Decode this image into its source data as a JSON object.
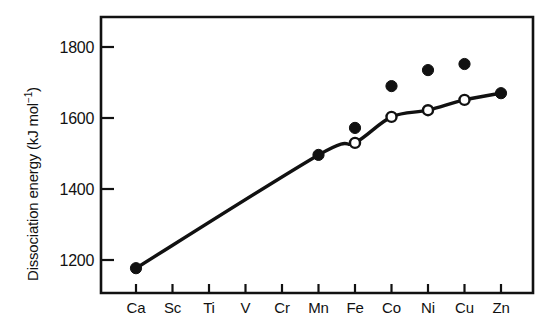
{
  "chart_data": {
    "type": "scatter",
    "title": "",
    "xlabel": "",
    "ylabel": "Dissociation energy (kJ mol⁻¹)",
    "ylabel_main": "Dissociation energy (kJ mol",
    "ylabel_superscript": "−1",
    "ylabel_close": ")",
    "categories": [
      "Ca",
      "Sc",
      "Ti",
      "V",
      "Cr",
      "Mn",
      "Fe",
      "Co",
      "Ni",
      "Cu",
      "Zn"
    ],
    "ylim": [
      1120,
      1860
    ],
    "yticks": [
      1200,
      1400,
      1600,
      1800
    ],
    "ytick_labels": [
      "1200",
      "1400",
      "1600",
      "1800"
    ],
    "grid": false,
    "legend": "none",
    "series": [
      {
        "name": "filled-circles",
        "marker": "filled circle",
        "x": [
          "Ca",
          "Mn",
          "Fe",
          "Co",
          "Ni",
          "Cu",
          "Zn"
        ],
        "values": [
          1177,
          1496,
          1572,
          1690,
          1735,
          1752,
          1670
        ]
      },
      {
        "name": "open-circles",
        "marker": "open circle",
        "x": [
          "Fe",
          "Co",
          "Ni",
          "Cu"
        ],
        "values": [
          1530,
          1603,
          1622,
          1651
        ]
      },
      {
        "name": "trend-curve",
        "marker": "none",
        "x": [
          "Ca",
          "Mn",
          "Fe",
          "Co",
          "Ni",
          "Cu",
          "Zn"
        ],
        "values": [
          1177,
          1496,
          1530,
          1603,
          1622,
          1651,
          1670
        ]
      }
    ]
  },
  "axes": {
    "y_tick_values": [
      1800,
      1600,
      1400,
      1200
    ],
    "x_tick_labels": [
      "Ca",
      "Sc",
      "Ti",
      "V",
      "Cr",
      "Mn",
      "Fe",
      "Co",
      "Ni",
      "Cu",
      "Zn"
    ]
  }
}
